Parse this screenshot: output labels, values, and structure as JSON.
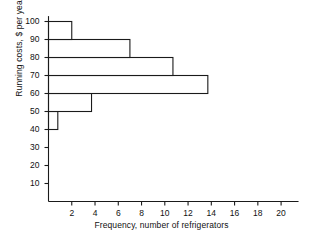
{
  "chart_data": {
    "type": "bar",
    "orientation": "horizontal",
    "title": "",
    "xlabel": "Frequency, number of refrigerators",
    "ylabel": "Running costs, $ per year",
    "xlim": [
      0,
      21.5
    ],
    "ylim": [
      0,
      103
    ],
    "grid": false,
    "legend": null,
    "xticks": [
      2,
      4,
      6,
      8,
      10,
      12,
      14,
      16,
      18,
      20
    ],
    "xtick_labels": [
      "2",
      "4",
      "6",
      "8",
      "10",
      "12",
      "14",
      "16",
      "18",
      "20"
    ],
    "yticks": [
      10,
      20,
      30,
      40,
      50,
      60,
      70,
      80,
      90,
      100
    ],
    "ytick_labels": [
      "10",
      "20",
      "30",
      "40",
      "50",
      "60",
      "70",
      "80",
      "90",
      "100"
    ],
    "bin_edges": [
      40,
      50,
      60,
      70,
      80,
      90,
      100
    ],
    "categories": [
      "40-50",
      "50-60",
      "60-70",
      "70-80",
      "80-90",
      "90-100"
    ],
    "values": [
      0.8,
      3.7,
      13.7,
      10.7,
      7.0,
      2.0
    ],
    "bars": [
      {
        "label": "40-50",
        "bin_low": 40,
        "bin_high": 50,
        "value": 0.8
      },
      {
        "label": "50-60",
        "bin_low": 50,
        "bin_high": 60,
        "value": 3.7
      },
      {
        "label": "60-70",
        "bin_low": 60,
        "bin_high": 70,
        "value": 13.7
      },
      {
        "label": "70-80",
        "bin_low": 70,
        "bin_high": 80,
        "value": 10.7
      },
      {
        "label": "80-90",
        "bin_low": 80,
        "bin_high": 90,
        "value": 7.0
      },
      {
        "label": "90-100",
        "bin_low": 90,
        "bin_high": 100,
        "value": 2.0
      }
    ],
    "colors": {
      "bar_fill": "#ffffff",
      "bar_stroke": "#1a1a1a",
      "axis": "#1a1a1a",
      "text": "#111111",
      "background": "#ffffff"
    }
  }
}
